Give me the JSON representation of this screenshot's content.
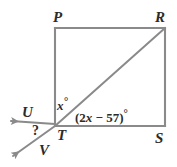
{
  "figure": {
    "kind": "geometry-diagram",
    "background_color": "#ffffff",
    "line_color": "#8a8a8a",
    "text_color": "#2b2b2b",
    "vertices": [
      {
        "id": "P",
        "label": "P",
        "x": 55,
        "y": 28
      },
      {
        "id": "R",
        "label": "R",
        "x": 165,
        "y": 28
      },
      {
        "id": "S",
        "label": "S",
        "x": 165,
        "y": 126
      },
      {
        "id": "T",
        "label": "T",
        "x": 55,
        "y": 126
      }
    ],
    "ray_endpoints": [
      {
        "id": "U",
        "label": "U",
        "x": 7,
        "y": 120
      },
      {
        "id": "V",
        "label": "V",
        "x": 10,
        "y": 158
      }
    ],
    "segments": [
      {
        "name": "PR",
        "from": "P",
        "to": "R"
      },
      {
        "name": "RS",
        "from": "R",
        "to": "S"
      },
      {
        "name": "ST",
        "from": "S",
        "to": "T"
      },
      {
        "name": "TP",
        "from": "T",
        "to": "P"
      },
      {
        "name": "RT-diagonal",
        "from": "R",
        "to": "T"
      }
    ],
    "rays": [
      {
        "name": "TU",
        "from": "T",
        "to": "U",
        "arrow": true
      },
      {
        "name": "TV",
        "from": "T",
        "to": "V",
        "arrow": true
      }
    ],
    "angle_labels": [
      {
        "name": "angle-x",
        "text": "x",
        "degree_symbol": "°"
      },
      {
        "name": "angle-expr",
        "lead": "(2",
        "var": "x",
        "tail": " − 57)",
        "degree_symbol": "°"
      },
      {
        "name": "angle-unknown",
        "text": "?"
      }
    ]
  }
}
